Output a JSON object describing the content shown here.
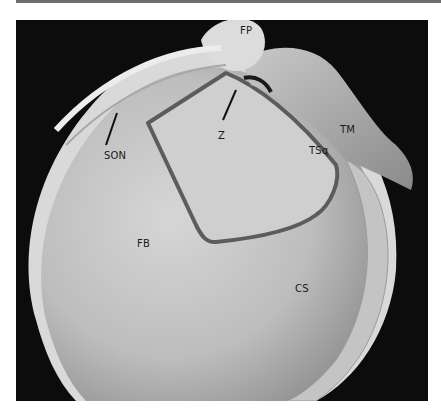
{
  "figure": {
    "type": "anatomical photograph",
    "labels": [
      {
        "id": "FP",
        "text": "FP",
        "x": 224,
        "y": 5
      },
      {
        "id": "TM",
        "text": "TM",
        "x": 324,
        "y": 104
      },
      {
        "id": "Z",
        "text": "Z",
        "x": 202,
        "y": 110
      },
      {
        "id": "SON",
        "text": "SON",
        "x": 16,
        "y": 138
      },
      {
        "id": "TSq",
        "text": "TSq",
        "x": 293,
        "y": 125
      },
      {
        "id": "FB",
        "text": "FB",
        "x": 121,
        "y": 218
      },
      {
        "id": "CS",
        "text": "CS",
        "x": 279,
        "y": 263
      }
    ]
  }
}
